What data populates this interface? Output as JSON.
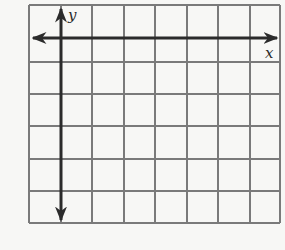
{
  "diagram": {
    "type": "coordinate-grid",
    "columns": 8,
    "rows": 7,
    "x_axis_label": "x",
    "y_axis_label": "y",
    "y_axis_column_index": 1,
    "x_axis_row_index": 1,
    "x_axis_arrows": "both",
    "y_axis_arrows": "both",
    "colors": {
      "grid_line": "#7a7a7a",
      "axis_line": "#2b2b2b",
      "background": "#f7f7f5"
    }
  }
}
